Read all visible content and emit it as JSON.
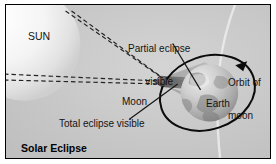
{
  "figure": {
    "caption": "Solar Eclipse",
    "background_color": "#c9c9c9",
    "border_color": "#000000"
  },
  "labels": {
    "sun": "SUN",
    "partial_eclipse_line1": "Partial eclipse",
    "partial_eclipse_line2": "visible",
    "orbit_line1": "Orbit of",
    "orbit_line2": "moon",
    "moon": "Moon",
    "earth": "Earth",
    "total_eclipse": "Total eclipse visible"
  },
  "bodies": {
    "sun": {
      "name": "sun-body",
      "cx": 22,
      "cy": 44,
      "r": 56,
      "color": "#f2f2f2"
    },
    "moon": {
      "name": "moon-body",
      "cx": 161,
      "cy": 78,
      "r": 5,
      "color": "#4a4a4a"
    },
    "earth": {
      "name": "earth-body",
      "cx": 205,
      "cy": 93,
      "r": 29,
      "color": "#b8b8b8"
    }
  },
  "shadow": {
    "umbra_color": "#6a6a6a",
    "penumbra_color": "#a8a8a8",
    "umbra_label": "Total eclipse visible",
    "penumbra_label": "Partial eclipse visible"
  },
  "orbit": {
    "name": "moon-orbit-ellipse",
    "color": "#000000",
    "direction": "counterclockwise",
    "arrow": "orbit-direction-arrow"
  },
  "rays": {
    "style": "dashed",
    "color": "#2b2b2b",
    "count": 4,
    "description": "tangent sunlight rays from sun edges to moon"
  },
  "icons": {
    "sun": "sun-icon",
    "moon": "moon-icon",
    "earth": "earth-icon",
    "arrow": "arrow-icon"
  }
}
